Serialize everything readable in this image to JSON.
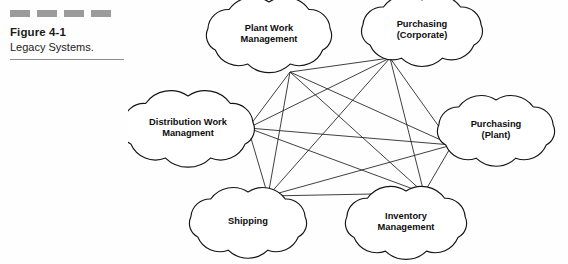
{
  "caption": {
    "dash_count": 4,
    "dash_color": "#9b9b9b",
    "figure_number": "Figure 4-1",
    "figure_title": "Legacy Systems."
  },
  "diagram": {
    "type": "node-network",
    "shape": "cloud",
    "stroke_color": "#141414",
    "fill_color": "#ffffff",
    "topology": "fully-connected",
    "node_count": 6,
    "edge_count": 15,
    "nodes": [
      {
        "id": "plant-work-management",
        "lines": [
          "Plant Work",
          "Management"
        ],
        "cx": 141,
        "cy": 34,
        "rx": 62,
        "ry": 32,
        "anchor_x": 162,
        "anchor_y": 72
      },
      {
        "id": "purchasing-corporate",
        "lines": [
          "Purchasing",
          "(Corporate)"
        ],
        "cx": 294,
        "cy": 30,
        "rx": 60,
        "ry": 30,
        "anchor_x": 262,
        "anchor_y": 58
      },
      {
        "id": "distribution-work-managment",
        "lines": [
          "Distribution Work",
          "Managment"
        ],
        "cx": 60,
        "cy": 128,
        "rx": 66,
        "ry": 32,
        "anchor_x": 120,
        "anchor_y": 128
      },
      {
        "id": "purchasing-plant",
        "lines": [
          "Purchasing",
          "(Plant)"
        ],
        "cx": 368,
        "cy": 130,
        "rx": 58,
        "ry": 30,
        "anchor_x": 324,
        "anchor_y": 145
      },
      {
        "id": "shipping",
        "lines": [
          "Shipping"
        ],
        "cx": 120,
        "cy": 222,
        "rx": 58,
        "ry": 30,
        "anchor_x": 140,
        "anchor_y": 196
      },
      {
        "id": "inventory-management",
        "lines": [
          "Inventory",
          "Management"
        ],
        "cx": 278,
        "cy": 222,
        "rx": 60,
        "ry": 31,
        "anchor_x": 296,
        "anchor_y": 193
      }
    ],
    "edges": [
      [
        "plant-work-management",
        "purchasing-corporate"
      ],
      [
        "plant-work-management",
        "distribution-work-managment"
      ],
      [
        "plant-work-management",
        "purchasing-plant"
      ],
      [
        "plant-work-management",
        "shipping"
      ],
      [
        "plant-work-management",
        "inventory-management"
      ],
      [
        "purchasing-corporate",
        "distribution-work-managment"
      ],
      [
        "purchasing-corporate",
        "purchasing-plant"
      ],
      [
        "purchasing-corporate",
        "shipping"
      ],
      [
        "purchasing-corporate",
        "inventory-management"
      ],
      [
        "distribution-work-managment",
        "purchasing-plant"
      ],
      [
        "distribution-work-managment",
        "shipping"
      ],
      [
        "distribution-work-managment",
        "inventory-management"
      ],
      [
        "purchasing-plant",
        "shipping"
      ],
      [
        "purchasing-plant",
        "inventory-management"
      ],
      [
        "shipping",
        "inventory-management"
      ]
    ]
  }
}
